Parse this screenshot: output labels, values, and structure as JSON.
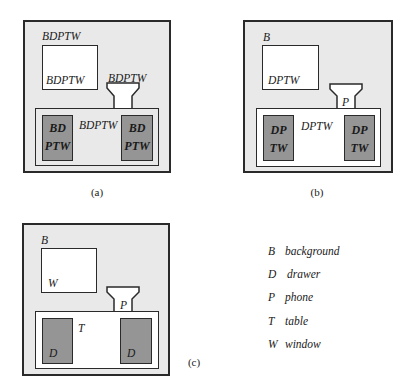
{
  "figure": {
    "colors": {
      "background_region": "#e9e9e9",
      "window": "#ffffff",
      "drawer": "#959595",
      "outline": "#2a2a2a"
    },
    "panels": [
      {
        "id": "a",
        "caption": "(a)",
        "table_fill": "gray",
        "labels": {
          "background": "BDPTW",
          "window": "BDPTW",
          "phone": "BDPTW",
          "table": "BDPTW",
          "drawer_left_line1": "BD",
          "drawer_left_line2": "PTW",
          "drawer_right_line1": "BD",
          "drawer_right_line2": "PTW"
        }
      },
      {
        "id": "b",
        "caption": "(b)",
        "table_fill": "white",
        "labels": {
          "background": "B",
          "window": "DPTW",
          "phone": "P",
          "table": "DPTW",
          "drawer_left_line1": "DP",
          "drawer_left_line2": "TW",
          "drawer_right_line1": "DP",
          "drawer_right_line2": "TW"
        }
      },
      {
        "id": "c",
        "caption": "(c)",
        "table_fill": "white",
        "labels": {
          "background": "B",
          "window": "W",
          "phone": "P",
          "table": "T",
          "drawer_left": "D",
          "drawer_right": "D"
        }
      }
    ],
    "legend": [
      {
        "key": "B",
        "name": "background"
      },
      {
        "key": "D",
        "name": "drawer"
      },
      {
        "key": "P",
        "name": "phone"
      },
      {
        "key": "T",
        "name": "table"
      },
      {
        "key": "W",
        "name": "window"
      }
    ]
  }
}
